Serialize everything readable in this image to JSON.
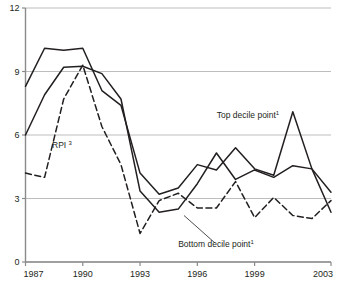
{
  "chart_data": {
    "type": "line",
    "title": "",
    "xlabel": "",
    "ylabel": "",
    "xlim": [
      1987,
      2003
    ],
    "ylim": [
      0,
      12
    ],
    "grid": true,
    "legend_position": "inline-annotations",
    "x": [
      1987,
      1988,
      1989,
      1990,
      1991,
      1992,
      1993,
      1994,
      1995,
      1996,
      1997,
      1998,
      1999,
      2000,
      2001,
      2002,
      2003
    ],
    "y_ticks": [
      "0",
      "3",
      "6",
      "9",
      "12"
    ],
    "y_tick_values": [
      0,
      3,
      6,
      9,
      12
    ],
    "x_ticks": [
      "1987",
      "1990",
      "1993",
      "1996",
      "1999",
      "2003"
    ],
    "x_tick_values": [
      1987,
      1990,
      1993,
      1996,
      1999,
      2003
    ],
    "series": [
      {
        "name": "Top decile point",
        "footnote": "1",
        "style": "solid",
        "values": [
          8.3,
          10.1,
          10.0,
          10.1,
          8.1,
          7.4,
          4.2,
          3.2,
          3.5,
          4.6,
          4.35,
          5.4,
          4.4,
          4.1,
          7.1,
          4.4,
          3.3
        ]
      },
      {
        "name": "Bottom decile point",
        "footnote": "1",
        "style": "solid",
        "values": [
          6.0,
          7.9,
          9.2,
          9.25,
          8.9,
          7.7,
          3.35,
          2.35,
          2.5,
          3.7,
          5.15,
          3.9,
          4.35,
          4.0,
          4.55,
          4.4,
          2.35
        ]
      },
      {
        "name": "RPI",
        "footnote": "3",
        "style": "dashed",
        "values": [
          4.2,
          4.0,
          7.7,
          9.3,
          6.4,
          4.6,
          1.35,
          2.9,
          3.25,
          2.55,
          2.55,
          3.8,
          2.1,
          3.05,
          2.2,
          2.05,
          2.9
        ]
      }
    ],
    "annotations": [
      {
        "id": "top-decile-label",
        "text": "Top decile point",
        "footnote": "1",
        "x": 248,
        "y": 118
      },
      {
        "id": "bottom-decile-label",
        "text": "Bottom decile point",
        "footnote": "1",
        "x": 216,
        "y": 247
      },
      {
        "id": "rpi-label",
        "text": "RPI",
        "footnote": "3",
        "x": 62,
        "y": 148
      }
    ]
  },
  "colors": {
    "line": "#231f20",
    "grid": "#b5b5b5",
    "axis": "#8a8a8a",
    "text": "#231f20",
    "background": "#ffffff"
  }
}
